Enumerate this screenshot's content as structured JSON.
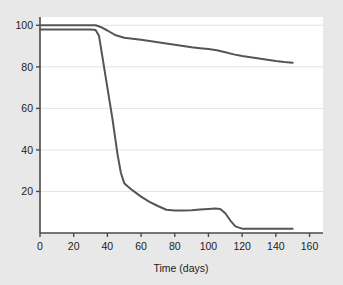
{
  "chart_data": {
    "type": "line",
    "title": "",
    "subtitle": "",
    "xlabel": "Time (days)",
    "ylabel": "",
    "xlim": [
      0,
      168
    ],
    "ylim": [
      0,
      104
    ],
    "xticks": [
      0,
      20,
      40,
      60,
      80,
      100,
      120,
      140,
      160
    ],
    "yticks": [
      20,
      40,
      60,
      80,
      100
    ],
    "xtick_labels": [
      "0",
      "20",
      "40",
      "60",
      "80",
      "100",
      "120",
      "140",
      "160"
    ],
    "ytick_labels": [
      "20",
      "40",
      "60",
      "80",
      "100"
    ],
    "grid": "horizontal",
    "legend": "none",
    "annotations": [],
    "line_color": "#555555",
    "line_width": 2,
    "plot_background": "#ffffff",
    "figure_background": "#e8e8e8",
    "grid_color": "#e4e4e4",
    "axis_color": "#4a4a4a",
    "series": [
      {
        "name": "upper-curve",
        "color": "#555555",
        "x": [
          0,
          10,
          20,
          30,
          33,
          36,
          40,
          45,
          50,
          55,
          60,
          65,
          70,
          75,
          80,
          85,
          90,
          95,
          100,
          105,
          110,
          115,
          120,
          125,
          130,
          135,
          140,
          145,
          150
        ],
        "values": [
          100,
          100,
          100,
          100,
          100,
          99.2,
          97.5,
          95.2,
          94.0,
          93.5,
          93.0,
          92.4,
          91.8,
          91.2,
          90.6,
          90.0,
          89.4,
          89.0,
          88.6,
          88.0,
          87.0,
          86.0,
          85.2,
          84.6,
          84.0,
          83.4,
          82.8,
          82.3,
          82.0
        ]
      },
      {
        "name": "lower-curve",
        "color": "#555555",
        "x": [
          0,
          10,
          20,
          30,
          33,
          35,
          37,
          40,
          43,
          46,
          48,
          50,
          52,
          55,
          60,
          65,
          70,
          75,
          80,
          85,
          90,
          95,
          100,
          104,
          107,
          110,
          113,
          116,
          120,
          125,
          130,
          135,
          140,
          145,
          150
        ],
        "values": [
          98,
          98,
          98,
          98,
          97.8,
          95.0,
          85.0,
          70.0,
          55.0,
          38.0,
          29.0,
          24.0,
          22.5,
          20.5,
          17.5,
          15.0,
          13.0,
          11.2,
          10.8,
          10.8,
          11.0,
          11.3,
          11.6,
          11.8,
          11.6,
          9.5,
          6.0,
          3.2,
          2.1,
          2.0,
          2.0,
          2.0,
          2.0,
          2.0,
          2.0
        ]
      }
    ]
  }
}
